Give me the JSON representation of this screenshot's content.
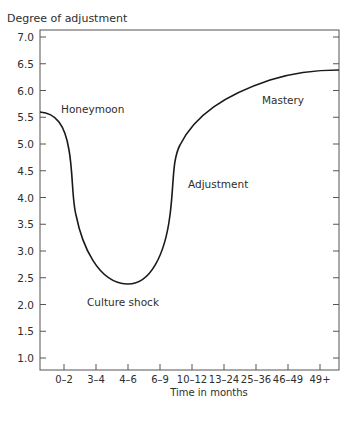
{
  "chart_data": {
    "type": "line",
    "title": "",
    "ylabel": "Degree of adjustment",
    "xlabel": "Time in months",
    "ylim": [
      1.0,
      7.0
    ],
    "yticks": [
      "7.0",
      "6.5",
      "6.0",
      "5.5",
      "5.0",
      "4.5",
      "4.0",
      "3.5",
      "3.0",
      "2.5",
      "2.0",
      "1.5",
      "1.0"
    ],
    "categories": [
      "0–2",
      "3–4",
      "4–6",
      "6–9",
      "10–12",
      "13–24",
      "25–36",
      "46–49",
      "49+"
    ],
    "grid": false,
    "legend": false,
    "series": [
      {
        "name": "Culture shock curve (U-curve)",
        "points": [
          {
            "x": "start",
            "y": 5.6
          },
          {
            "x": "0–2",
            "y": 4.9
          },
          {
            "x": "0–2/3–4",
            "y": 3.8
          },
          {
            "x": "3–4",
            "y": 2.9
          },
          {
            "x": "4–6",
            "y": 2.4
          },
          {
            "x": "6–9",
            "y": 2.9
          },
          {
            "x": "6–9/10–12",
            "y": 4.3
          },
          {
            "x": "10–12",
            "y": 5.2
          },
          {
            "x": "13–24",
            "y": 5.75
          },
          {
            "x": "25–36",
            "y": 6.1
          },
          {
            "x": "46–49",
            "y": 6.3
          },
          {
            "x": "49+",
            "y": 6.4
          },
          {
            "x": "end",
            "y": 6.4
          }
        ]
      }
    ],
    "annotations": [
      {
        "text": "Honeymoon",
        "near_y": 5.6
      },
      {
        "text": "Culture shock",
        "near_y": 2.1
      },
      {
        "text": "Adjustment",
        "near_y": 4.3
      },
      {
        "text": "Mastery",
        "near_y": 6.1
      }
    ]
  },
  "labels": {
    "ylabel": "Degree of adjustment",
    "xlabel": "Time in months",
    "honeymoon": "Honeymoon",
    "culture_shock": "Culture shock",
    "adjustment": "Adjustment",
    "mastery": "Mastery",
    "yticks": [
      "7.0",
      "6.5",
      "6.0",
      "5.5",
      "5.0",
      "4.5",
      "4.0",
      "3.5",
      "3.0",
      "2.5",
      "2.0",
      "1.5",
      "1.0"
    ],
    "xticks": [
      "0–2",
      "3–4",
      "4–6",
      "6–9",
      "10–12",
      "13–24",
      "25–36",
      "46–49",
      "49+"
    ]
  },
  "colors": {
    "line": "#1a1a1a",
    "axis": "#555555",
    "text": "#2e2e2e"
  }
}
